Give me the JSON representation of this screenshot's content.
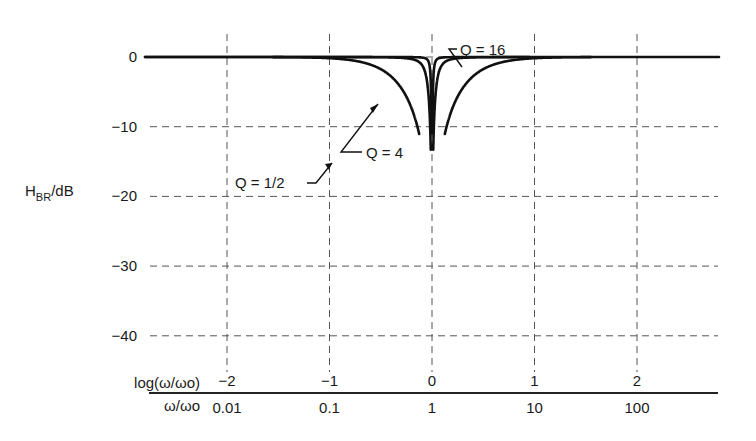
{
  "chart_data": {
    "type": "line",
    "title": "",
    "ylabel": "H_BR/dB",
    "ylabel_main": "H",
    "ylabel_sub": "BR",
    "ylabel_unit": "/dB",
    "xlabel_log": "log(ω/ωo)",
    "xlabel_lin": "ω/ωo",
    "xaxis_log_ticks": [
      "−2",
      "−1",
      "0",
      "1",
      "2"
    ],
    "xaxis_log_values": [
      -2,
      -1,
      0,
      1,
      2
    ],
    "xaxis_lin_ticks": [
      "0.01",
      "0.1",
      "1",
      "10",
      "100"
    ],
    "yaxis_ticks": [
      "0",
      "−10",
      "−20",
      "−30",
      "−40"
    ],
    "yaxis_values": [
      0,
      -10,
      -20,
      -30,
      -40
    ],
    "xlim_log": [
      -2.8,
      2.8
    ],
    "ylim": [
      -42,
      0
    ],
    "grid": true,
    "legend_position": "inline annotations",
    "series": [
      {
        "name": "Q = 1/2",
        "Q": 0.5,
        "log_x_range": [
          -1.55,
          1.55
        ],
        "points": [
          [
            -1.5,
            -0.7
          ],
          [
            -1,
            -1.9
          ],
          [
            -0.5,
            -5.3
          ],
          [
            -0.2,
            -13.7
          ],
          [
            -0.1,
            -19.6
          ],
          [
            -0.05,
            -25.5
          ],
          [
            0.05,
            -25.5
          ],
          [
            0.1,
            -19.6
          ],
          [
            0.2,
            -13.7
          ],
          [
            0.5,
            -5.3
          ],
          [
            1,
            -1.9
          ],
          [
            1.5,
            -0.7
          ]
        ]
      },
      {
        "name": "Q = 4",
        "Q": 4,
        "log_x_range": [
          -2.8,
          2.8
        ],
        "points": [
          [
            -2,
            0
          ],
          [
            -1,
            -0.05
          ],
          [
            -0.5,
            -0.5
          ],
          [
            -0.2,
            -2.5
          ],
          [
            -0.1,
            -6.6
          ],
          [
            -0.05,
            -11.4
          ],
          [
            -0.01,
            -24.6
          ],
          [
            0.01,
            -24.6
          ],
          [
            0.05,
            -11.4
          ],
          [
            0.1,
            -6.6
          ],
          [
            0.2,
            -2.5
          ],
          [
            0.5,
            -0.5
          ],
          [
            1,
            -0.05
          ],
          [
            2,
            0
          ]
        ]
      },
      {
        "name": "Q = 16",
        "Q": 16,
        "log_x_range": [
          -1.6,
          1.6
        ],
        "points": [
          [
            -1.5,
            0
          ],
          [
            -0.5,
            -0.03
          ],
          [
            -0.2,
            -0.2
          ],
          [
            -0.1,
            -0.8
          ],
          [
            -0.05,
            -2.9
          ],
          [
            -0.02,
            -9.6
          ],
          [
            -0.005,
            -21.1
          ],
          [
            0.005,
            -21.1
          ],
          [
            0.02,
            -9.6
          ],
          [
            0.05,
            -2.9
          ],
          [
            0.1,
            -0.8
          ],
          [
            0.2,
            -0.2
          ],
          [
            0.5,
            -0.03
          ],
          [
            1.5,
            0
          ]
        ]
      }
    ],
    "annotations": [
      {
        "text": "Q = 16",
        "target_series": "Q = 16"
      },
      {
        "text": "Q = 4",
        "target_series": "Q = 4"
      },
      {
        "text": "Q = 1/2",
        "target_series": "Q = 1/2"
      }
    ]
  }
}
